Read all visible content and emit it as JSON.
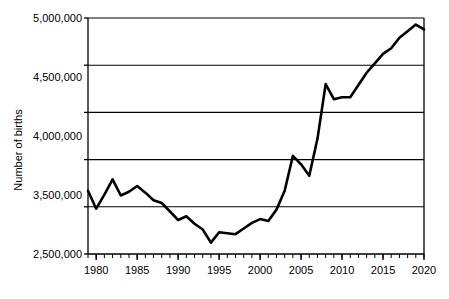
{
  "chart_data": {
    "type": "line",
    "title": "",
    "xlabel": "",
    "ylabel": "Number of births",
    "xlim": [
      1979,
      2020
    ],
    "ylim": [
      2500000,
      5000000
    ],
    "grid": true,
    "legend": "none",
    "y_tick_labels": [
      "5,000,000",
      "4,500,000",
      "4,000,000",
      "3,500,000",
      "3,000,000",
      "2,500,000"
    ],
    "y_tick_values": [
      5000000,
      4500000,
      4000000,
      3500000,
      3000000,
      2500000
    ],
    "x_tick_labels": [
      "1980",
      "1985",
      "1990",
      "1995",
      "2000",
      "2005",
      "2010",
      "2015",
      "2020"
    ],
    "x_tick_values": [
      1980,
      1985,
      1990,
      1995,
      2000,
      2005,
      2010,
      2015,
      2020
    ],
    "x_minor_tick_step": 1,
    "line_color": "#000000",
    "line_width": 2.6,
    "axis_color": "#000000",
    "grid_color": "#000000",
    "background_color": "#ffffff",
    "x": [
      1979,
      1980,
      1981,
      1982,
      1983,
      1984,
      1985,
      1986,
      1987,
      1988,
      1989,
      1990,
      1991,
      1992,
      1993,
      1994,
      1995,
      1996,
      1997,
      1998,
      1999,
      2000,
      2001,
      2002,
      2003,
      2004,
      2005,
      2006,
      2007,
      2008,
      2009,
      2010,
      2011,
      2012,
      2013,
      2014,
      2015,
      2016,
      2017,
      2018,
      2019,
      2020
    ],
    "values": [
      3170000,
      2980000,
      3130000,
      3290000,
      3120000,
      3160000,
      3220000,
      3150000,
      3070000,
      3040000,
      2950000,
      2860000,
      2900000,
      2820000,
      2760000,
      2620000,
      2730000,
      2720000,
      2710000,
      2770000,
      2830000,
      2870000,
      2850000,
      2970000,
      3170000,
      3540000,
      3450000,
      3330000,
      3720000,
      4300000,
      4140000,
      4160000,
      4160000,
      4290000,
      4420000,
      4520000,
      4620000,
      4680000,
      4790000,
      4860000,
      4930000,
      4880000
    ],
    "series_name": "Number of births"
  }
}
